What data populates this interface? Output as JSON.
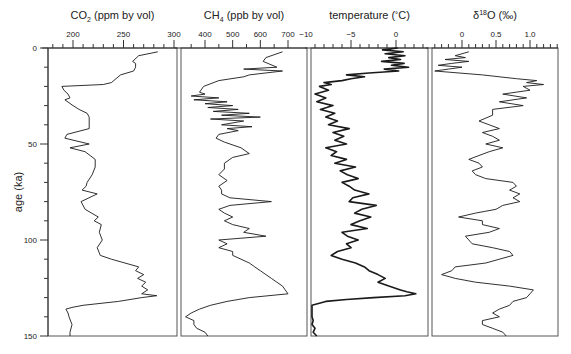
{
  "chart_data": {
    "type": "line",
    "layout": "four vertically-oriented stacked panels sharing a y-axis (age), values on top x-axes",
    "y_axis": {
      "label": "age (ka)",
      "range": [
        0,
        150
      ],
      "inverted": true,
      "ticks": [
        0,
        50,
        100,
        150
      ],
      "minor_tick_step": 10
    },
    "grid": false,
    "legend": "none",
    "panels": [
      {
        "id": "co2",
        "title": "CO",
        "title_sub": "2",
        "title_rest": " (ppm by vol)",
        "xlabel": "CO2 (ppm by vol)",
        "xlim": [
          177,
          300
        ],
        "ticks": [
          200,
          250,
          300
        ],
        "tick_labels": [
          "200",
          "250",
          "300"
        ],
        "minor_tick_step": 10,
        "series": {
          "age": [
            2,
            4,
            7,
            8,
            10,
            12,
            14,
            18,
            19,
            20,
            22,
            24,
            26,
            27,
            30,
            32,
            34,
            36,
            38,
            42,
            45,
            47,
            50,
            52,
            54,
            58,
            62,
            66,
            70,
            72,
            74,
            76,
            80,
            84,
            88,
            90,
            92,
            96,
            100,
            104,
            108,
            110,
            114,
            116,
            118,
            120,
            122,
            124,
            126,
            128,
            129,
            130,
            132,
            134,
            135,
            136,
            138,
            140,
            144,
            148,
            150
          ],
          "value": [
            284,
            265,
            259,
            262,
            262,
            260,
            247,
            238,
            230,
            189,
            191,
            195,
            197,
            192,
            200,
            206,
            214,
            216,
            216,
            216,
            194,
            192,
            216,
            197,
            212,
            222,
            222,
            219,
            214,
            213,
            209,
            224,
            208,
            212,
            225,
            221,
            228,
            226,
            229,
            224,
            227,
            238,
            265,
            262,
            270,
            264,
            272,
            268,
            274,
            268,
            283,
            268,
            245,
            210,
            200,
            193,
            195,
            196,
            199,
            197,
            197
          ]
        }
      },
      {
        "id": "ch4",
        "title": "CH",
        "title_sub": "4",
        "title_rest": " (ppb by vol)",
        "xlabel": "CH4 (ppb by vol)",
        "xlim": [
          310,
          720
        ],
        "ticks": [
          400,
          500,
          600,
          700
        ],
        "tick_labels": [
          "400",
          "500",
          "600",
          "700"
        ],
        "minor_tick_step": 50,
        "series": {
          "age": [
            2,
            5,
            7,
            10,
            11,
            12,
            14,
            15,
            17,
            20,
            23,
            24,
            25,
            26,
            27,
            28,
            29,
            30,
            31,
            32,
            33,
            34,
            35,
            36,
            37,
            38,
            40,
            41,
            42,
            43,
            45,
            47,
            49,
            52,
            55,
            57,
            60,
            63,
            66,
            69,
            72,
            74,
            76,
            78,
            80,
            82,
            84,
            86,
            88,
            90,
            92,
            94,
            96,
            98,
            100,
            102,
            104,
            106,
            108,
            110,
            112,
            114,
            116,
            118,
            120,
            122,
            124,
            126,
            128,
            130,
            132,
            134,
            136,
            138,
            140,
            142,
            144,
            146,
            148,
            150
          ],
          "value": [
            680,
            620,
            610,
            660,
            540,
            680,
            560,
            540,
            450,
            395,
            380,
            400,
            350,
            450,
            360,
            480,
            400,
            500,
            410,
            520,
            430,
            560,
            460,
            600,
            420,
            540,
            460,
            570,
            480,
            520,
            450,
            440,
            470,
            530,
            560,
            500,
            470,
            470,
            450,
            480,
            450,
            460,
            460,
            490,
            640,
            490,
            450,
            470,
            500,
            470,
            500,
            560,
            540,
            620,
            450,
            480,
            450,
            500,
            500,
            530,
            560,
            580,
            600,
            620,
            640,
            660,
            680,
            690,
            700,
            560,
            480,
            420,
            380,
            350,
            330,
            360,
            360,
            370,
            400,
            410
          ]
        }
      },
      {
        "id": "temperature",
        "title": "temperature (",
        "title_deg": "˚",
        "title_rest": "C)",
        "xlabel": "temperature (˚C)",
        "xlim": [
          -10.5,
          3.0
        ],
        "ticks": [
          -10,
          -5,
          0
        ],
        "tick_labels": [
          "−10",
          "−5",
          "0"
        ],
        "minor_tick_step": 1,
        "series": {
          "age": [
            0,
            1,
            2,
            3,
            4,
            5,
            6,
            7,
            8,
            9,
            10,
            11,
            12,
            13,
            14,
            15,
            16,
            17,
            18,
            19,
            20,
            22,
            24,
            26,
            28,
            30,
            32,
            34,
            36,
            38,
            40,
            42,
            44,
            46,
            48,
            50,
            52,
            54,
            56,
            58,
            60,
            62,
            64,
            66,
            68,
            70,
            72,
            74,
            76,
            78,
            80,
            82,
            84,
            86,
            88,
            90,
            92,
            94,
            96,
            98,
            100,
            102,
            104,
            106,
            108,
            110,
            112,
            114,
            116,
            118,
            120,
            122,
            124,
            126,
            127,
            128,
            129,
            130,
            131,
            132,
            134,
            136,
            138,
            140,
            142,
            144,
            146,
            148,
            150
          ],
          "value": [
            0.2,
            -1.5,
            0.8,
            -1.2,
            1.0,
            -0.8,
            0.5,
            -1.6,
            0.9,
            -0.5,
            1.4,
            -1.3,
            0.3,
            -3.0,
            -5.5,
            -3.5,
            -5.0,
            -6.0,
            -8.0,
            -7.2,
            -8.5,
            -7.5,
            -9.0,
            -7.8,
            -8.8,
            -7.0,
            -8.4,
            -6.8,
            -7.8,
            -6.5,
            -7.5,
            -5.2,
            -7.0,
            -5.8,
            -6.8,
            -5.5,
            -7.8,
            -6.6,
            -7.2,
            -5.5,
            -6.8,
            -4.5,
            -6.2,
            -5.4,
            -4.2,
            -6.0,
            -5.2,
            -4.6,
            -3.0,
            -4.8,
            -5.2,
            -2.2,
            -3.8,
            -4.6,
            -2.8,
            -4.0,
            -5.0,
            -3.2,
            -6.0,
            -5.4,
            -4.2,
            -5.5,
            -5.0,
            -6.5,
            -7.2,
            -6.0,
            -4.5,
            -3.5,
            -3.0,
            -2.0,
            -1.2,
            -2.0,
            -0.8,
            0.5,
            1.2,
            2.2,
            1.0,
            -2.5,
            -5.5,
            -7.8,
            -9.5,
            -9.8,
            -9.5,
            -9.8,
            -9.2,
            -9.5,
            -9.0,
            -9.2,
            -8.8
          ]
        }
      },
      {
        "id": "d18o",
        "title": "δ",
        "title_sup": "18",
        "title_rest": "O (‰)",
        "xlabel": "δ18O (‰)",
        "xlim": [
          -0.45,
          1.45
        ],
        "ticks": [
          0,
          0.5,
          1.0
        ],
        "tick_labels": [
          "0",
          "0.5",
          "1.0"
        ],
        "minor_tick_step": 0.1,
        "series": {
          "age": [
            2,
            4,
            5,
            6,
            7,
            8,
            9,
            10,
            11,
            12,
            14,
            16,
            17,
            18,
            19,
            20,
            22,
            24,
            26,
            28,
            30,
            32,
            35,
            38,
            40,
            42,
            44,
            46,
            48,
            50,
            52,
            54,
            56,
            58,
            60,
            62,
            64,
            66,
            68,
            70,
            72,
            74,
            76,
            78,
            80,
            82,
            84,
            85,
            86,
            88,
            90,
            92,
            94,
            96,
            98,
            100,
            102,
            104,
            106,
            108,
            110,
            112,
            114,
            116,
            118,
            120,
            122,
            124,
            126,
            128,
            130,
            132,
            134,
            136,
            138,
            140,
            142,
            144,
            146,
            148,
            150
          ],
          "value": [
            0.1,
            -0.1,
            0.05,
            -0.25,
            0.1,
            -0.15,
            -0.35,
            0.0,
            -0.2,
            -0.4,
            0.3,
            0.8,
            1.1,
            0.95,
            1.2,
            0.9,
            1.0,
            0.6,
            0.95,
            0.55,
            0.9,
            0.45,
            0.45,
            0.25,
            0.4,
            0.55,
            0.3,
            0.45,
            0.55,
            0.35,
            0.6,
            0.4,
            0.25,
            0.1,
            0.25,
            0.3,
            0.15,
            0.2,
            0.35,
            0.75,
            0.8,
            0.7,
            0.85,
            0.75,
            0.85,
            0.6,
            0.5,
            0.35,
            0.2,
            -0.05,
            0.3,
            0.3,
            0.55,
            0.4,
            0.05,
            0.1,
            0.15,
            0.45,
            0.7,
            0.75,
            0.55,
            0.35,
            -0.1,
            -0.15,
            -0.3,
            -0.1,
            0.2,
            0.7,
            1.05,
            1.0,
            0.95,
            0.75,
            0.7,
            0.55,
            0.45,
            0.55,
            0.3,
            0.3,
            0.45,
            0.6,
            0.65
          ]
        }
      }
    ]
  },
  "axis_labels": {
    "y": "age (ka)",
    "y_ticks": [
      "0",
      "50",
      "100",
      "150"
    ]
  },
  "colors": {
    "line": "#1a1a1a",
    "axis": "#333333",
    "frame": "#555555",
    "background": "#ffffff"
  }
}
